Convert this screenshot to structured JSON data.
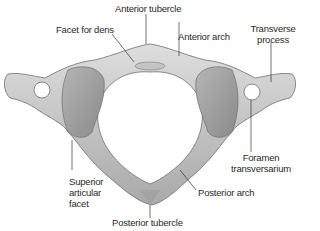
{
  "diagram": {
    "bone_color": "#c9c9c9",
    "bone_shadow_color": "#8f8f8f",
    "leader_line_color": "#333333"
  },
  "labels": {
    "anterior_tubercle": "Anterior tubercle",
    "facet_for_dens": "Facet for dens",
    "anterior_arch": "Anterior arch",
    "transverse_process_line1": "Transverse",
    "transverse_process_line2": "process",
    "superior_articular_facet_line1": "Superior",
    "superior_articular_facet_line2": "articular",
    "superior_articular_facet_line3": "facet",
    "foramen_transversarium_line1": "Foramen",
    "foramen_transversarium_line2": "transversarium",
    "posterior_arch": "Posterior arch",
    "posterior_tubercle": "Posterior tubercle"
  }
}
